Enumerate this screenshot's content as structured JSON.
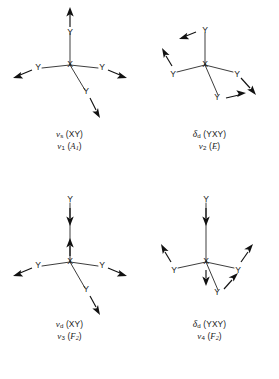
{
  "figure": {
    "center_atom": "X",
    "ligand_atom": "Y",
    "background_color": "#ffffff",
    "ink_color": "#1a1a1a"
  },
  "panels": [
    {
      "id": "nu1",
      "position": "top-left",
      "mode_name": "symmetric stretching",
      "caption_line1": {
        "symbol": "ν",
        "symbol_sub": "s",
        "description": "(XY)",
        "full": "νs (XY)"
      },
      "caption_line2": {
        "symbol": "ν",
        "symbol_sub": "1",
        "description": "(A1)",
        "species": "A",
        "species_sub": "1",
        "full": "ν1 (A1)"
      },
      "atom_labels": [
        "Y",
        "Y",
        "X",
        "Y",
        "Y"
      ]
    },
    {
      "id": "nu2",
      "position": "top-right",
      "mode_name": "degenerate bending",
      "caption_line1": {
        "symbol": "δ",
        "symbol_sub": "d",
        "description": "(YXY)",
        "full": "δd (YXY)"
      },
      "caption_line2": {
        "symbol": "ν",
        "symbol_sub": "2",
        "description": "(E)",
        "species": "E",
        "species_sub": "",
        "full": "ν2 (E)"
      },
      "atom_labels": [
        "Y",
        "Y",
        "X",
        "Y",
        "Y"
      ]
    },
    {
      "id": "nu3",
      "position": "bottom-left",
      "mode_name": "degenerate stretching",
      "caption_line1": {
        "symbol": "ν",
        "symbol_sub": "d",
        "description": "(XY)",
        "full": "νd (XY)"
      },
      "caption_line2": {
        "symbol": "ν",
        "symbol_sub": "3",
        "description": "(F2)",
        "species": "F",
        "species_sub": "2",
        "full": "ν3 (F2)"
      },
      "atom_labels": [
        "Y",
        "Y",
        "X",
        "Y",
        "Y"
      ]
    },
    {
      "id": "nu4",
      "position": "bottom-right",
      "mode_name": "degenerate bending",
      "caption_line1": {
        "symbol": "δ",
        "symbol_sub": "d",
        "description": "(YXY)",
        "full": "δd (YXY)"
      },
      "caption_line2": {
        "symbol": "ν",
        "symbol_sub": "4",
        "description": "(F2)",
        "species": "F",
        "species_sub": "2",
        "full": "ν4 (F2)"
      },
      "atom_labels": [
        "Y",
        "Y",
        "X",
        "Y",
        "Y"
      ]
    }
  ]
}
